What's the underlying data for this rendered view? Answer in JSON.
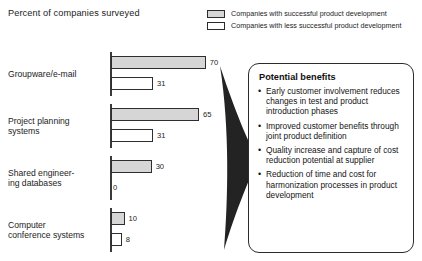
{
  "chart_data": {
    "type": "bar",
    "orientation": "horizontal",
    "title": "Percent of companies surveyed",
    "xlabel": "",
    "ylabel": "",
    "xlim": [
      0,
      100
    ],
    "grid": false,
    "legend_position": "top-right",
    "categories": [
      "Groupware/e-mail",
      "Project planning systems",
      "Shared engineer-\ning databases",
      "Computer\nconference systems"
    ],
    "series": [
      {
        "name": "Companies with successful product development",
        "style": "filled",
        "values": [
          70,
          65,
          30,
          10
        ]
      },
      {
        "name": "Companies with less successful product development",
        "style": "empty",
        "values": [
          31,
          31,
          0,
          8
        ]
      }
    ]
  },
  "legend": {
    "items": [
      {
        "label": "Companies with successful product development",
        "style": "filled"
      },
      {
        "label": "Companies with less successful product development",
        "style": "empty"
      }
    ]
  },
  "groups": [
    {
      "label": "Groupware/e-mail",
      "label_lines": [
        "Groupware/e-mail"
      ],
      "top": {
        "value": 70,
        "value_text": "70",
        "style": "filled"
      },
      "bottom": {
        "value": 31,
        "value_text": "31",
        "style": "empty"
      }
    },
    {
      "label": "Project planning systems",
      "label_lines": [
        "Project planning",
        "systems"
      ],
      "top": {
        "value": 65,
        "value_text": "65",
        "style": "filled"
      },
      "bottom": {
        "value": 31,
        "value_text": "31",
        "style": "empty"
      }
    },
    {
      "label": "Shared engineering databases",
      "label_lines": [
        "Shared engineer-",
        "ing databases"
      ],
      "top": {
        "value": 30,
        "value_text": "30",
        "style": "filled"
      },
      "bottom": {
        "value": 0,
        "value_text": "0",
        "style": "empty"
      }
    },
    {
      "label": "Computer conference systems",
      "label_lines": [
        "Computer",
        "conference systems"
      ],
      "top": {
        "value": 10,
        "value_text": "10",
        "style": "filled"
      },
      "bottom": {
        "value": 8,
        "value_text": "8",
        "style": "empty"
      }
    }
  ],
  "panel": {
    "title": "Potential benefits",
    "bullet_glyph": "•",
    "benefits": [
      "Early customer involvement reduces changes in test and product introduction phases",
      "Improved customer benefits through joint product definition",
      "Quality increase and capture of cost reduction potential at supplier",
      "Reduction of time and cost for harmonization processes in product development"
    ]
  },
  "colors": {
    "bar_fill": "#d6d6d6",
    "bar_empty": "#ffffff",
    "stroke": "#2e2e2e",
    "arrow": "#232323",
    "text": "#1c1c1c"
  }
}
